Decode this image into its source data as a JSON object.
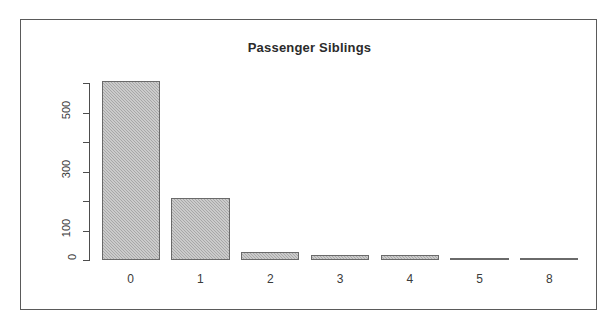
{
  "figure": {
    "background_color": "#ffffff",
    "frame_color": "#5a5a5a",
    "bar_fill_color": "#a8a8a8",
    "bar_border_color": "#6a6a6a",
    "axis_color": "#4d4d4d",
    "text_color": "#3a3a3a"
  },
  "chart_data": {
    "type": "bar",
    "title": "Passenger Siblings",
    "xlabel": "",
    "ylabel": "",
    "categories": [
      "0",
      "1",
      "2",
      "3",
      "4",
      "5",
      "8"
    ],
    "values": [
      608,
      209,
      28,
      16,
      18,
      5,
      7
    ],
    "ylim": [
      0,
      600
    ],
    "yticks": [
      0,
      100,
      200,
      300,
      400,
      500,
      600
    ],
    "ytick_labels": [
      "0",
      "100",
      "",
      "300",
      "",
      "500",
      ""
    ],
    "ytick_label_rotation": 90,
    "grid": false,
    "legend": null,
    "legend_position": "none"
  }
}
